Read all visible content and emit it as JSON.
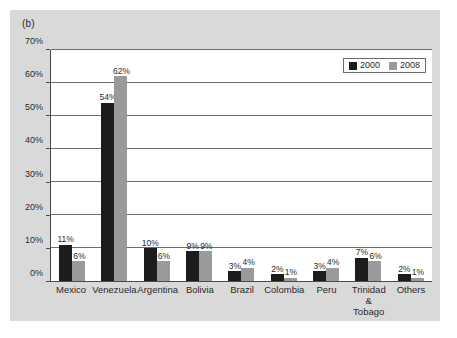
{
  "figure": {
    "panel_label": "(b)",
    "background_color": "#d9d9d9",
    "plot_background_color": "#ffffff"
  },
  "legend": {
    "position": "top-right",
    "entries": [
      {
        "label": "2000",
        "color": "#1c1c1c"
      },
      {
        "label": "2008",
        "color": "#9a9a9a"
      }
    ]
  },
  "chart_data": {
    "type": "bar",
    "title": "",
    "subtitle": "",
    "xlabel": "",
    "ylabel": "",
    "ylim": [
      0,
      70
    ],
    "yticks": [
      0,
      10,
      20,
      30,
      40,
      50,
      60,
      70
    ],
    "ytick_labels": [
      "0%",
      "10%",
      "20%",
      "30%",
      "40%",
      "50%",
      "60%",
      "70%"
    ],
    "grid": true,
    "legend_position": "top-right",
    "categories": [
      "Mexico",
      "Venezuela",
      "Argentina",
      "Bolivia",
      "Brazil",
      "Colombia",
      "Peru",
      "Trinidad &\nTobago",
      "Others"
    ],
    "series": [
      {
        "name": "2000",
        "color": "#1c1c1c",
        "values": [
          11,
          54,
          10,
          9,
          3,
          2,
          3,
          7,
          2
        ],
        "data_labels": [
          "11%",
          "54%",
          "10%",
          "9%",
          "3%",
          "2%",
          "3%",
          "7%",
          "2%"
        ]
      },
      {
        "name": "2008",
        "color": "#9a9a9a",
        "values": [
          6,
          62,
          6,
          9,
          4,
          1,
          4,
          6,
          1
        ],
        "data_labels": [
          "6%",
          "62%",
          "6%",
          "9%",
          "4%",
          "1%",
          "4%",
          "6%",
          "1%"
        ]
      }
    ]
  }
}
